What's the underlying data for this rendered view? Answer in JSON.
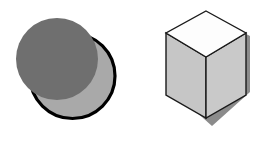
{
  "canvas": {
    "width": 261,
    "height": 149,
    "background_color": "#ffffff",
    "title": "Two geometric shape illustrations: overlapping circles and an isometric cube"
  },
  "colors": {
    "background": "#ffffff",
    "circle_front_fill": "#6f6f6f",
    "circle_back_fill": "#a9a9a9",
    "circle_back_stroke": "#000000",
    "cube_top_fill": "#fdfdfd",
    "cube_left_fill": "#c6c6c6",
    "cube_right_fill": "#c9c9c9",
    "cube_stroke": "#1a1a1a",
    "cube_shadow_fill": "#8b8b8b"
  },
  "shapes": {
    "circles_group": {
      "name": "overlapping-circles",
      "label": "Overlapping circles",
      "back_circle": {
        "label": "Light gray outlined circle",
        "cx": 72.5,
        "cy": 76.0,
        "r": 42.5,
        "fill": "#a9a9a9",
        "stroke": "#000000",
        "stroke_width": 3.2
      },
      "front_circle": {
        "label": "Dark gray circle",
        "cx": 57.0,
        "cy": 59.0,
        "r": 41.0,
        "fill": "#6f6f6f",
        "stroke": "none",
        "stroke_width": 0
      }
    },
    "cube_group": {
      "name": "isometric-cube",
      "label": "Isometric cube",
      "shadow": {
        "label": "Cube drop shadow",
        "points": "174,36 212,16 250,36 250,92 212,126 174,92",
        "fill": "#8b8b8b"
      },
      "top_face": {
        "label": "Cube top face",
        "points": "206,11 246,33 206,57 166,33",
        "fill": "#fdfdfd",
        "stroke": "#1a1a1a",
        "stroke_width": 1.4
      },
      "left_face": {
        "label": "Cube left face",
        "points": "166,33 206,57 206,118 166,95",
        "fill": "#c6c6c6",
        "stroke": "#1a1a1a",
        "stroke_width": 1.4
      },
      "right_face": {
        "label": "Cube right face",
        "points": "206,57 246,33 246,95 206,118",
        "fill": "#c9c9c9",
        "stroke": "#1a1a1a",
        "stroke_width": 1.4
      }
    }
  }
}
